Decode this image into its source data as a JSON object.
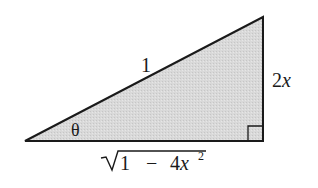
{
  "diagram": {
    "type": "right-triangle",
    "fill_color": "#d6d6d6",
    "stroke_color": "#1a1a1a",
    "labels": {
      "hypotenuse": "1",
      "opposite": {
        "coefficient": "2",
        "variable": "x"
      },
      "adjacent": {
        "radical_symbol": "√",
        "term1": "1",
        "operator": "−",
        "coefficient": "4",
        "variable": "x",
        "exponent": "2"
      },
      "angle": "θ"
    },
    "right_angle_marker": true
  }
}
